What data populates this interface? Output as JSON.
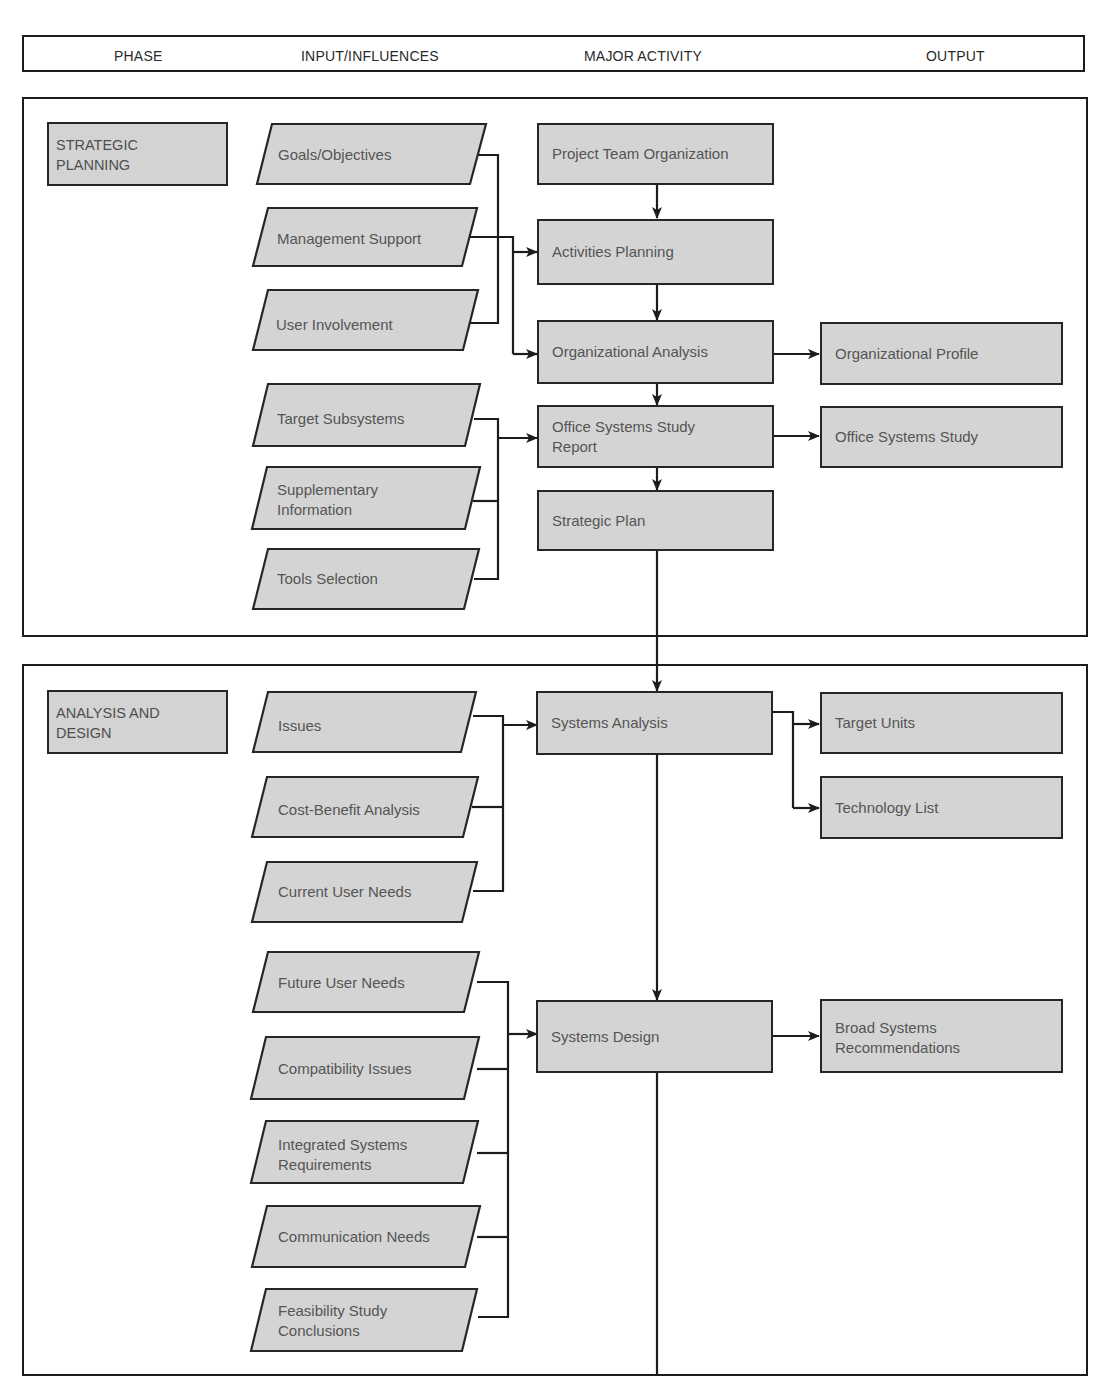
{
  "header": {
    "columns": [
      {
        "label": "PHASE"
      },
      {
        "label": "INPUT/INFLUENCES"
      },
      {
        "label": "MAJOR ACTIVITY"
      },
      {
        "label": "OUTPUT"
      }
    ]
  },
  "colors": {
    "box_fill": "#d4d4d4",
    "box_border": "#262626",
    "box_text": "#555555",
    "line": "#1c1c1c",
    "background": "#ffffff"
  },
  "sections": [
    {
      "phase": "STRATEGIC\nPLANNING",
      "inputs": [
        {
          "label": "Goals/Objectives"
        },
        {
          "label": "Management Support"
        },
        {
          "label": "User Involvement"
        },
        {
          "label": "Target Subsystems"
        },
        {
          "label": "Supplementary\nInformation"
        },
        {
          "label": "Tools Selection"
        }
      ],
      "activities": [
        {
          "label": "Project Team Organization"
        },
        {
          "label": "Activities Planning"
        },
        {
          "label": "Organizational Analysis"
        },
        {
          "label": "Office Systems Study\nReport"
        },
        {
          "label": "Strategic Plan"
        }
      ],
      "outputs": [
        {
          "label": "Organizational Profile"
        },
        {
          "label": "Office Systems Study"
        }
      ]
    },
    {
      "phase": "ANALYSIS AND\nDESIGN",
      "inputs": [
        {
          "label": "Issues"
        },
        {
          "label": "Cost-Benefit Analysis"
        },
        {
          "label": "Current User Needs"
        },
        {
          "label": "Future User Needs"
        },
        {
          "label": "Compatibility Issues"
        },
        {
          "label": "Integrated Systems\nRequirements"
        },
        {
          "label": "Communication Needs"
        },
        {
          "label": "Feasibility Study\nConclusions"
        }
      ],
      "activities": [
        {
          "label": "Systems Analysis"
        },
        {
          "label": "Systems Design"
        }
      ],
      "outputs": [
        {
          "label": "Target Units"
        },
        {
          "label": "Technology List"
        },
        {
          "label": "Broad Systems\nRecommendations"
        }
      ]
    }
  ]
}
